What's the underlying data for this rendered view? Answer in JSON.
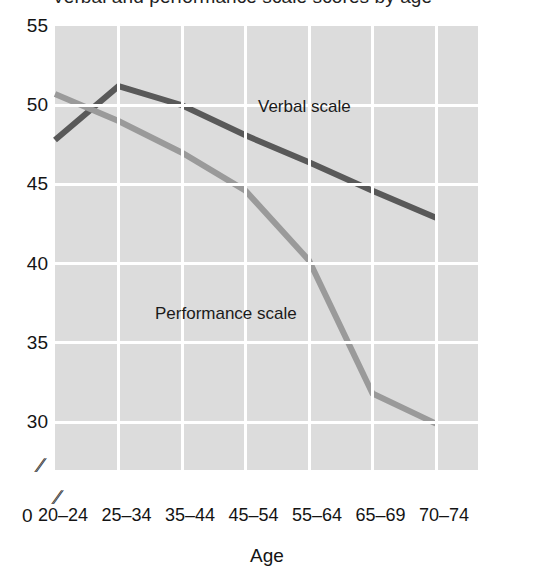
{
  "chart_data": {
    "type": "line",
    "title": "Verbal and performance scale scores by age",
    "xlabel": "Age",
    "ylabel": "",
    "categories": [
      "20–24",
      "25–34",
      "35–44",
      "45–54",
      "55–64",
      "65–69",
      "70–74"
    ],
    "ylim": [
      30,
      55
    ],
    "yticks": [
      "55",
      "50",
      "45",
      "40",
      "35",
      "30"
    ],
    "ytick_values": [
      55,
      50,
      45,
      40,
      35,
      30
    ],
    "y_origin_label": "0",
    "x_origin_label": "0",
    "axis_break_symbol": "∕∕",
    "grid": true,
    "legend_position": "inline-annotations",
    "series": [
      {
        "name": "Verbal scale",
        "color": "#595959",
        "values": [
          47.8,
          51.2,
          50.0,
          48.1,
          46.4,
          44.6,
          42.9
        ]
      },
      {
        "name": "Performance scale",
        "color": "#9a9a9a",
        "values": [
          50.7,
          49.0,
          47.0,
          44.6,
          40.2,
          31.8,
          29.9
        ]
      }
    ],
    "annotations": [
      {
        "text": "Verbal scale",
        "series": "Verbal scale"
      },
      {
        "text": "Performance scale",
        "series": "Performance scale"
      }
    ],
    "plot_background": "#dcdcdc",
    "gridline_color": "#ffffff"
  }
}
